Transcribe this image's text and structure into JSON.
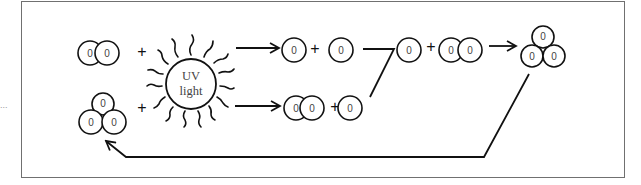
{
  "diagram": {
    "type": "ozone-oxygen cycle",
    "atom_label": "0",
    "plus_sign": "+",
    "sun": {
      "label_line1": "UV",
      "label_line2": "light"
    },
    "left_margin_mark": "...",
    "nodes": {
      "top_left_molecule": "O2 (two atoms)",
      "bottom_left_molecule": "O3 (three atoms)",
      "top_products": [
        "O",
        "O"
      ],
      "bottom_products": [
        "O2",
        "O"
      ],
      "merge_products": [
        "O",
        "O2"
      ],
      "final_product": "O3 (three atoms)"
    },
    "colors": {
      "stroke": "#111111",
      "atom_text": "#444444",
      "frame": "#707070"
    }
  }
}
